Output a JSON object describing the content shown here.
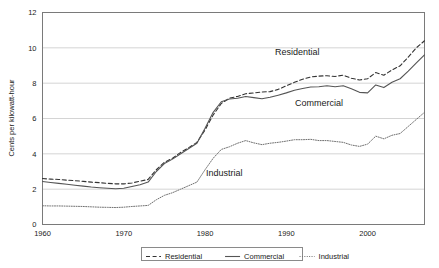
{
  "chart_data": {
    "type": "line",
    "title": "",
    "xlabel": "",
    "ylabel": "Cents per kilowatt-hour",
    "xlim": [
      1960,
      2007
    ],
    "ylim": [
      0,
      12
    ],
    "xticks": [
      1960,
      1970,
      1980,
      1990,
      2000
    ],
    "yticks": [
      0,
      2,
      4,
      6,
      8,
      10,
      12
    ],
    "xtick_labels": [
      "1960",
      "1970",
      "1980",
      "1990",
      "2000"
    ],
    "ytick_labels": [
      "0",
      "2",
      "4",
      "6",
      "8",
      "10",
      "12"
    ],
    "grid": "horizontal",
    "legend_position": "bottom-center",
    "x": [
      1960,
      1961,
      1962,
      1963,
      1964,
      1965,
      1966,
      1967,
      1968,
      1969,
      1970,
      1971,
      1972,
      1973,
      1974,
      1975,
      1976,
      1977,
      1978,
      1979,
      1980,
      1981,
      1982,
      1983,
      1984,
      1985,
      1986,
      1987,
      1988,
      1989,
      1990,
      1991,
      1992,
      1993,
      1994,
      1995,
      1996,
      1997,
      1998,
      1999,
      2000,
      2001,
      2002,
      2003,
      2004,
      2005,
      2006,
      2007
    ],
    "series": [
      {
        "name": "Residential",
        "style": "dashed",
        "color": "#333333",
        "label_in_plot": "Residential",
        "values": [
          2.6,
          2.57,
          2.55,
          2.51,
          2.48,
          2.44,
          2.4,
          2.37,
          2.33,
          2.3,
          2.3,
          2.35,
          2.45,
          2.55,
          3.1,
          3.52,
          3.75,
          4.08,
          4.35,
          4.65,
          5.35,
          6.2,
          6.85,
          7.15,
          7.25,
          7.4,
          7.45,
          7.5,
          7.52,
          7.65,
          7.85,
          8.05,
          8.22,
          8.35,
          8.4,
          8.42,
          8.38,
          8.45,
          8.28,
          8.18,
          8.25,
          8.6,
          8.45,
          8.75,
          8.98,
          9.48,
          10.0,
          10.4
        ]
      },
      {
        "name": "Commercial",
        "style": "solid",
        "color": "#555555",
        "label_in_plot": "Commercial",
        "values": [
          2.43,
          2.38,
          2.33,
          2.28,
          2.22,
          2.17,
          2.12,
          2.08,
          2.05,
          2.02,
          2.05,
          2.15,
          2.25,
          2.4,
          3.0,
          3.45,
          3.7,
          4.0,
          4.3,
          4.6,
          5.45,
          6.35,
          6.95,
          7.1,
          7.15,
          7.25,
          7.18,
          7.12,
          7.2,
          7.32,
          7.45,
          7.6,
          7.7,
          7.78,
          7.8,
          7.85,
          7.8,
          7.85,
          7.68,
          7.48,
          7.45,
          7.9,
          7.75,
          8.05,
          8.25,
          8.68,
          9.15,
          9.6
        ]
      },
      {
        "name": "Industrial",
        "style": "dotted",
        "color": "#707070",
        "label_in_plot": "Industrial",
        "values": [
          1.06,
          1.05,
          1.05,
          1.04,
          1.03,
          1.02,
          1.0,
          0.98,
          0.97,
          0.96,
          0.98,
          1.02,
          1.05,
          1.08,
          1.4,
          1.65,
          1.8,
          2.0,
          2.2,
          2.4,
          3.1,
          3.75,
          4.25,
          4.4,
          4.6,
          4.75,
          4.62,
          4.52,
          4.6,
          4.65,
          4.72,
          4.8,
          4.8,
          4.82,
          4.75,
          4.75,
          4.7,
          4.65,
          4.5,
          4.42,
          4.55,
          5.0,
          4.85,
          5.05,
          5.15,
          5.55,
          5.95,
          6.35
        ]
      }
    ]
  },
  "legend": {
    "items": [
      {
        "label": "Residential",
        "style": "dashed"
      },
      {
        "label": "Commercial",
        "style": "solid"
      },
      {
        "label": "Industrial",
        "style": "dotted"
      }
    ]
  }
}
